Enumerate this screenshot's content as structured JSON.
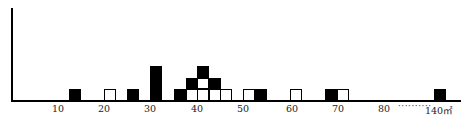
{
  "chart_data": {
    "type": "dot-histogram",
    "title": "",
    "xlabel": "",
    "unit": "㎡",
    "ylabel": "",
    "x_ticks": [
      {
        "label": "10",
        "x": 58
      },
      {
        "label": "20",
        "x": 104
      },
      {
        "label": "30",
        "x": 150
      },
      {
        "label": "40",
        "x": 197
      },
      {
        "label": "50",
        "x": 243
      },
      {
        "label": "60",
        "x": 292
      },
      {
        "label": "70",
        "x": 338
      },
      {
        "label": "80",
        "x": 384
      },
      {
        "label": "140㎡",
        "x": 439
      }
    ],
    "axis_break": "··········",
    "legend": [
      {
        "name": "black squares",
        "color": "#000000"
      },
      {
        "name": "white squares",
        "color": "#ffffff"
      }
    ],
    "cell_size": {
      "w": 12,
      "h": 11.5
    },
    "columns": [
      {
        "x_px": 69,
        "approx_value": 13,
        "stack_bottom_to_top": [
          "black"
        ]
      },
      {
        "x_px": 104,
        "approx_value": 21,
        "stack_bottom_to_top": [
          "white"
        ]
      },
      {
        "x_px": 127,
        "approx_value": 26,
        "stack_bottom_to_top": [
          "black"
        ]
      },
      {
        "x_px": 150,
        "approx_value": 31,
        "stack_bottom_to_top": [
          "black",
          "black",
          "black"
        ]
      },
      {
        "x_px": 174,
        "approx_value": 36,
        "stack_bottom_to_top": [
          "black"
        ]
      },
      {
        "x_px": 186,
        "approx_value": 39,
        "stack_bottom_to_top": [
          "white",
          "black"
        ]
      },
      {
        "x_px": 197,
        "approx_value": 41,
        "stack_bottom_to_top": [
          "white",
          "white",
          "black"
        ]
      },
      {
        "x_px": 209,
        "approx_value": 44,
        "stack_bottom_to_top": [
          "white",
          "black"
        ]
      },
      {
        "x_px": 220,
        "approx_value": 46,
        "stack_bottom_to_top": [
          "white"
        ]
      },
      {
        "x_px": 243,
        "approx_value": 51,
        "stack_bottom_to_top": [
          "white"
        ]
      },
      {
        "x_px": 255,
        "approx_value": 53,
        "stack_bottom_to_top": [
          "black"
        ]
      },
      {
        "x_px": 290,
        "approx_value": 61,
        "stack_bottom_to_top": [
          "white"
        ]
      },
      {
        "x_px": 325,
        "approx_value": 68,
        "stack_bottom_to_top": [
          "black"
        ]
      },
      {
        "x_px": 337,
        "approx_value": 70,
        "stack_bottom_to_top": [
          "white"
        ]
      },
      {
        "x_px": 434,
        "approx_value": 140,
        "stack_bottom_to_top": [
          "black"
        ]
      }
    ],
    "counts": {
      "black": 13,
      "white": 10
    },
    "grid": false
  }
}
